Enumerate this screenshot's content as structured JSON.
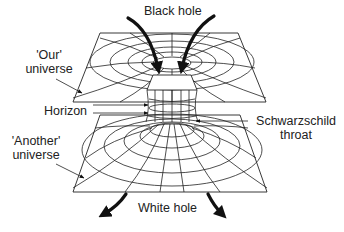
{
  "figure": {
    "labels": {
      "black_hole": "Black hole",
      "white_hole": "White hole",
      "our_universe_line1": "'Our'",
      "our_universe_line2": "universe",
      "another_universe_line1": "'Another'",
      "another_universe_line2": "universe",
      "horizon": "Horizon",
      "throat_line1": "Schwarzschild",
      "throat_line2": "throat"
    },
    "colors": {
      "line": "#222222",
      "background": "#ffffff"
    }
  }
}
